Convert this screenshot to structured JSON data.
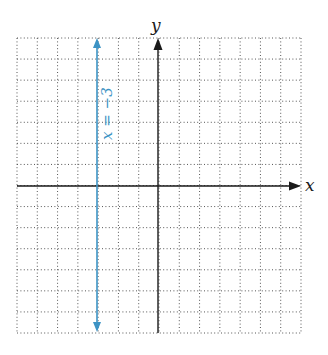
{
  "graph": {
    "x_axis_label": "x",
    "y_axis_label": "y",
    "grid": {
      "x_min": -7,
      "x_max": 7,
      "y_min": -7,
      "y_max": 7,
      "step": 1,
      "style": "dotted"
    },
    "line": {
      "equation_label": "x = −3",
      "x_value": -3,
      "color": "#3d93c4",
      "type": "vertical",
      "arrows": "both"
    },
    "axis_color": "#1a1a1a",
    "grid_color": "#555555"
  }
}
